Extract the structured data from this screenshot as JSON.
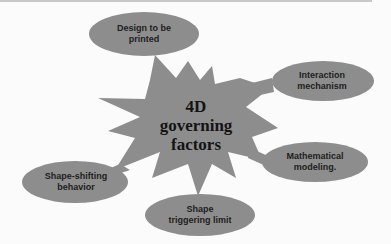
{
  "diagram": {
    "type": "starburst-concept-map",
    "center": {
      "lines": [
        "4D",
        "governing",
        "factors"
      ]
    },
    "nodes": [
      {
        "id": "design",
        "lines": [
          "Design to be",
          "printed"
        ]
      },
      {
        "id": "interaction",
        "lines": [
          "Interaction",
          "mechanism"
        ]
      },
      {
        "id": "math",
        "lines": [
          "Mathematical",
          "modeling."
        ]
      },
      {
        "id": "trigger",
        "lines": [
          "Shape",
          "triggering limit"
        ]
      },
      {
        "id": "shifting",
        "lines": [
          "Shape-shifting",
          "behavior"
        ]
      }
    ],
    "colors": {
      "shape_fill": "#8d8d8d",
      "text": "#1e1e1e",
      "background": "#fbfbfb"
    }
  }
}
